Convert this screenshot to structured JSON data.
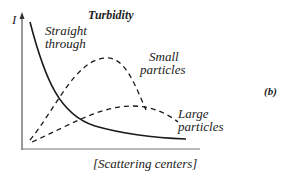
{
  "title": "Turbidity",
  "y_axis_label": "I",
  "x_axis_label": "[Scattering centers]",
  "panel_label": "(b)",
  "curves": [
    {
      "name": "straight-through",
      "label_line1": "Straight",
      "label_line2": "through",
      "style": "solid"
    },
    {
      "name": "small-particles",
      "label_line1": "Small",
      "label_line2": "particles",
      "style": "dashed"
    },
    {
      "name": "large-particles",
      "label_line1": "Large",
      "label_line2": "particles",
      "style": "dashed"
    }
  ],
  "colors": {
    "line": "#1a1a1a",
    "axis": "#555555",
    "text": "#222222"
  }
}
